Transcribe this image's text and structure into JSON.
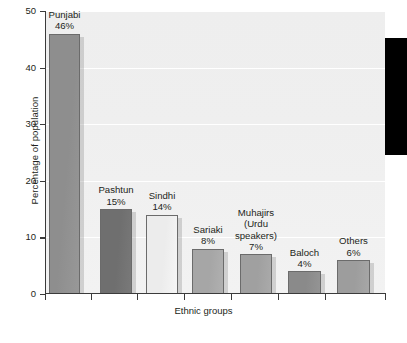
{
  "chart_data": {
    "type": "bar",
    "title": "",
    "xlabel": "Ethnic groups",
    "ylabel": "Percentage of population",
    "categories": [
      "Punjabi",
      "Pashtun",
      "Sindhi",
      "Sariaki",
      "Muhajirs (Urdu speakers)",
      "Baloch",
      "Others"
    ],
    "values": [
      46,
      15,
      14,
      8,
      7,
      4,
      6
    ],
    "value_labels": [
      "46%",
      "15%",
      "14%",
      "8%",
      "7%",
      "4%",
      "6%"
    ],
    "ylim": [
      0,
      50
    ],
    "yticks": [
      0,
      10,
      20,
      30,
      40,
      50
    ],
    "ytick_labels": [
      "0",
      "10",
      "20",
      "30",
      "40",
      "50"
    ],
    "grid": true,
    "grid_axis": "y",
    "legend": false,
    "bars": [
      {
        "category": "Punjabi",
        "label_lines": "Punjabi",
        "value": 46,
        "value_label": "46%",
        "color": "#8e8e8e",
        "x": 49,
        "width": 31
      },
      {
        "category": "Pashtun",
        "label_lines": "Pashtun",
        "value": 15,
        "value_label": "15%",
        "color": "#6f6f6f",
        "x": 100,
        "width": 32
      },
      {
        "category": "Sindhi",
        "label_lines": "Sindhi",
        "value": 14,
        "value_label": "14%",
        "color": "#ececec",
        "x": 146,
        "width": 32
      },
      {
        "category": "Sariaki",
        "label_lines": "Sariaki",
        "value": 8,
        "value_label": "8%",
        "color": "#a6a6a6",
        "x": 192,
        "width": 32
      },
      {
        "category": "Muhajirs",
        "label_lines": "Muhajirs\n(Urdu\nspeakers)",
        "value": 7,
        "value_label": "7%",
        "color": "#a0a0a0",
        "x": 240,
        "width": 32
      },
      {
        "category": "Baloch",
        "label_lines": "Baloch",
        "value": 4,
        "value_label": "4%",
        "color": "#8a8a8a",
        "x": 288,
        "width": 33
      },
      {
        "category": "Others",
        "label_lines": "Others",
        "value": 6,
        "value_label": "6%",
        "color": "#9d9d9d",
        "x": 337,
        "width": 33
      }
    ],
    "xticks_px": [
      45,
      91,
      137,
      184,
      231,
      278,
      325,
      385
    ],
    "annotations": [
      {
        "name": "black-block",
        "color": "#000000",
        "x": 385,
        "y": 38,
        "width": 22,
        "height": 117
      }
    ]
  }
}
